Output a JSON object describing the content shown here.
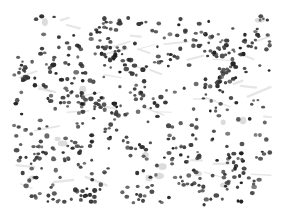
{
  "image": {
    "kind": "grayscale micrograph",
    "description": "Dense field of dark stained cell nuclei scattered on a white background",
    "canvas": {
      "width": 282,
      "height": 223,
      "background": "#ffffff"
    },
    "field": {
      "x": 13,
      "y": 15,
      "width": 258,
      "height": 191
    },
    "nuclei": {
      "count": 620,
      "seed": 7,
      "radius_min": 1.3,
      "radius_max": 2.4,
      "colors": [
        "#1c1c1c",
        "#2a2a2a",
        "#333333",
        "#3d3d3d",
        "#4a4a4a",
        "#555555"
      ],
      "cluster_bias": 0.55
    },
    "streaks": {
      "count": 40,
      "color": "#c8c8c8",
      "opacity": 0.45
    },
    "blobs": {
      "count": 14,
      "color": "#9a9a9a",
      "opacity": 0.35
    }
  }
}
